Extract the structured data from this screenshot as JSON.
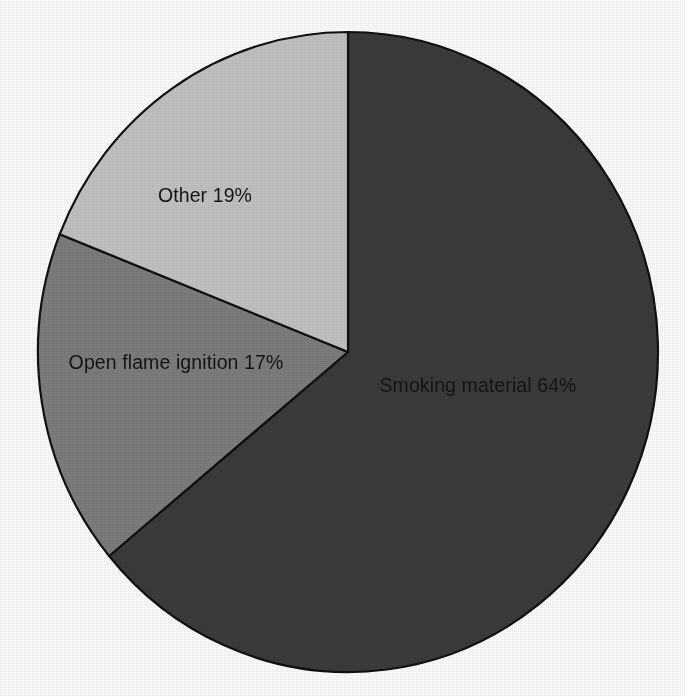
{
  "chart_data": {
    "type": "pie",
    "title": "",
    "subtitle": "",
    "xlabel": "",
    "ylabel": "",
    "grid": false,
    "legend_position": "none",
    "labels_inside_slices": true,
    "units": "percent",
    "total": 100,
    "start_angle_deg": 0,
    "direction": "clockwise",
    "categories": [
      "Smoking material",
      "Open flame ignition",
      "Other"
    ],
    "values": [
      64,
      17,
      19
    ],
    "slices": [
      {
        "name": "smoking-material",
        "category": "Smoking material",
        "value": 64,
        "value_text": "64%",
        "label": "Smoking material 64%",
        "color": "#3c3c3c",
        "start_angle_deg": 0,
        "end_angle_deg": 230.4,
        "label_x": 478,
        "label_y": 387,
        "label_anchor": "middle",
        "label_fill": "#151515"
      },
      {
        "name": "open-flame-ignition",
        "category": "Open flame ignition",
        "value": 17,
        "value_text": "17%",
        "label": "Open flame ignition 17%",
        "color": "#7e7e7e",
        "start_angle_deg": 230.4,
        "end_angle_deg": 291.6,
        "label_x": 176,
        "label_y": 364,
        "label_anchor": "middle",
        "label_fill": "#151515"
      },
      {
        "name": "other",
        "category": "Other",
        "value": 19,
        "value_text": "19%",
        "label": "Other 19%",
        "color": "#c4c4c4",
        "start_angle_deg": 291.6,
        "end_angle_deg": 360,
        "label_x": 205,
        "label_y": 197,
        "label_anchor": "middle",
        "label_fill": "#151515"
      }
    ],
    "geometry": {
      "center_x": 348,
      "center_y": 352,
      "radius_x": 310,
      "radius_y": 320
    },
    "style": {
      "background": "#ffffff",
      "outline_color": "#111111",
      "outline_width": 2.2
    }
  }
}
